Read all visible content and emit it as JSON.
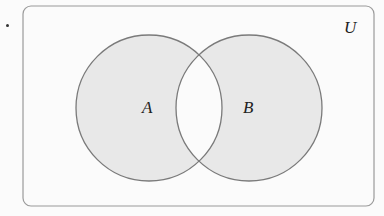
{
  "diagram": {
    "type": "venn",
    "universe_label": "U",
    "sets": [
      {
        "label": "A",
        "cx": 149,
        "cy": 108,
        "r": 73
      },
      {
        "label": "B",
        "cx": 249,
        "cy": 108,
        "r": 73
      }
    ],
    "shaded_regions": [
      "A only",
      "B only"
    ],
    "unshaded_regions": [
      "A ∩ B",
      "outside A ∪ B"
    ],
    "colors": {
      "shade": "#e8e8e8",
      "stroke": "#7a7a7a",
      "background": "#fbfbfb",
      "border": "#9a9a9a"
    }
  }
}
